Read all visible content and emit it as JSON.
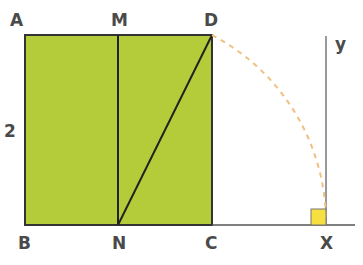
{
  "diagram": {
    "labels": {
      "A": "A",
      "M": "M",
      "D": "D",
      "B": "B",
      "N": "N",
      "C": "C",
      "X": "X",
      "y": "y",
      "side": "2"
    },
    "colors": {
      "fill": "#b5cc3a",
      "stroke": "#333333",
      "arc": "#f0c080",
      "right_angle": "#f5e040",
      "axis": "#555555",
      "label": "#4a4a4a"
    }
  }
}
